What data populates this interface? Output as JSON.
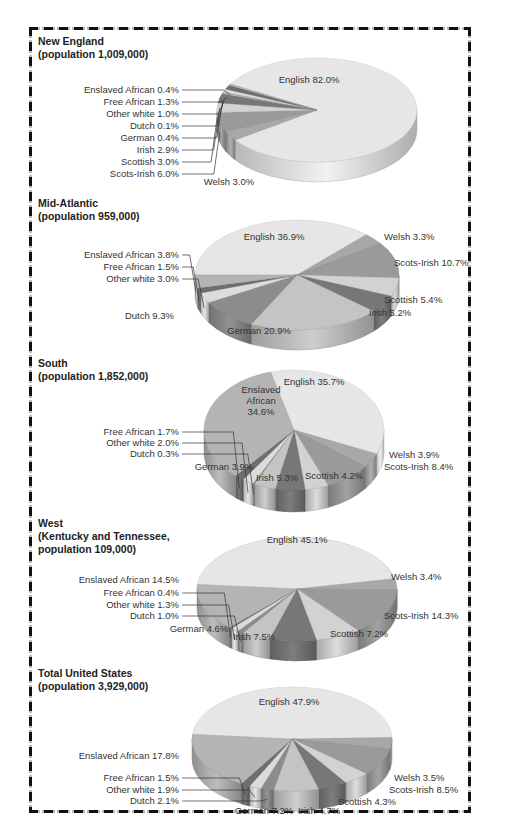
{
  "chart_data": [
    {
      "type": "pie",
      "title": "New England",
      "subtitle": "(population 1,009,000)",
      "categories": [
        "English",
        "Welsh",
        "Scots-Irish",
        "Scottish",
        "Irish",
        "German",
        "Dutch",
        "Other white",
        "Free African",
        "Enslaved African"
      ],
      "values": [
        82.0,
        3.0,
        6.0,
        3.0,
        2.9,
        0.4,
        0.1,
        1.0,
        1.3,
        0.4
      ],
      "labels": [
        "English 82.0%",
        "Welsh 3.0%",
        "Scots-Irish 6.0%",
        "Scottish 3.0%",
        "Irish 2.9%",
        "German 0.4%",
        "Dutch 0.1%",
        "Other white 1.0%",
        "Free African 1.3%",
        "Enslaved African 0.4%"
      ]
    },
    {
      "type": "pie",
      "title": "Mid-Atlantic",
      "subtitle": "(population 959,000)",
      "categories": [
        "English",
        "Welsh",
        "Scots-Irish",
        "Scottish",
        "Irish",
        "German",
        "Dutch",
        "Other white",
        "Free African",
        "Enslaved African"
      ],
      "values": [
        36.9,
        3.3,
        10.7,
        5.4,
        5.2,
        20.9,
        9.3,
        3.0,
        1.5,
        3.8
      ],
      "labels": [
        "English 36.9%",
        "Welsh 3.3%",
        "Scots-Irish 10.7%",
        "Scottish 5.4%",
        "Irish 5.2%",
        "German 20.9%",
        "Dutch 9.3%",
        "Other white 3.0%",
        "Free African 1.5%",
        "Enslaved African 3.8%"
      ]
    },
    {
      "type": "pie",
      "title": "South",
      "subtitle": "(population 1,852,000)",
      "categories": [
        "English",
        "Welsh",
        "Scots-Irish",
        "Scottish",
        "Irish",
        "German",
        "Dutch",
        "Other white",
        "Free African",
        "Enslaved African"
      ],
      "values": [
        35.7,
        3.9,
        8.4,
        4.2,
        5.3,
        3.9,
        0.3,
        2.0,
        1.7,
        34.6
      ],
      "labels": [
        "English 35.7%",
        "Welsh 3.9%",
        "Scots-Irish 8.4%",
        "Scottish 4.2%",
        "Irish 5.3%",
        "German 3.9%",
        "Dutch 0.3%",
        "Other white 2.0%",
        "Free African 1.7%",
        "Enslaved African 34.6%"
      ]
    },
    {
      "type": "pie",
      "title": "West",
      "subtitle": "(Kentucky and Tennessee,\npopulation 109,000)",
      "categories": [
        "English",
        "Welsh",
        "Scots-Irish",
        "Scottish",
        "Irish",
        "German",
        "Dutch",
        "Other white",
        "Free African",
        "Enslaved African"
      ],
      "values": [
        45.1,
        3.4,
        14.3,
        7.2,
        7.5,
        4.6,
        1.0,
        1.3,
        0.4,
        14.5
      ],
      "labels": [
        "English 45.1%",
        "Welsh 3.4%",
        "Scots-Irish 14.3%",
        "Scottish 7.2%",
        "Irish 7.5%",
        "German 4.6%",
        "Dutch 1.0%",
        "Other white 1.3%",
        "Free African 0.4%",
        "Enslaved African 14.5%"
      ]
    },
    {
      "type": "pie",
      "title": "Total United States",
      "subtitle": "(population 3,929,000)",
      "categories": [
        "English",
        "Welsh",
        "Scots-Irish",
        "Scottish",
        "Irish",
        "German",
        "Dutch",
        "Other white",
        "Free African",
        "Enslaved African"
      ],
      "values": [
        47.9,
        3.5,
        8.5,
        4.3,
        4.7,
        7.2,
        2.1,
        1.9,
        1.5,
        17.8
      ],
      "labels": [
        "English 47.9%",
        "Welsh 3.5%",
        "Scots-Irish 8.5%",
        "Scottish 4.3%",
        "Irish 4.7%",
        "German 7.2%",
        "Dutch 2.1%",
        "Other white 1.9%",
        "Free African 1.5%",
        "Enslaved African 17.8%"
      ]
    }
  ],
  "palette": {
    "English": "#e6e6e6",
    "Welsh": "#a8a8a8",
    "Scots-Irish": "#9a9a9a",
    "Scottish": "#d2d2d2",
    "Irish": "#777777",
    "German": "#c4c4c4",
    "Dutch": "#8c8c8c",
    "Other white": "#dcdcdc",
    "Free African": "#6e6e6e",
    "Enslaved African": "#b4b4b4"
  },
  "sections": [
    {
      "title": "New England",
      "subtitle": "(population 1,009,000)"
    },
    {
      "title": "Mid-Atlantic",
      "subtitle": "(population 959,000)"
    },
    {
      "title": "South",
      "subtitle": "(population 1,852,000)"
    },
    {
      "title": "West",
      "subtitle": "(Kentucky and Tennessee,\npopulation 109,000)"
    },
    {
      "title": "Total United States",
      "subtitle": "(population 3,929,000)"
    }
  ]
}
